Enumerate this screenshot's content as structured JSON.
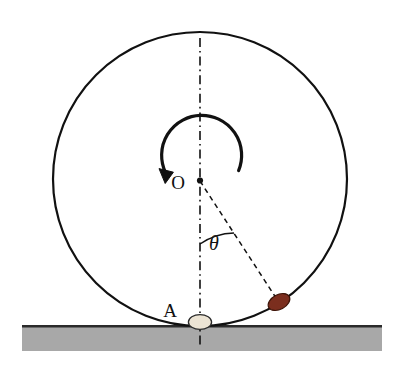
{
  "figure": {
    "background_color": "#ffffff"
  },
  "labels": {
    "center_label": "O",
    "contact_label": "A",
    "angle_label": "θ"
  },
  "colors": {
    "outline": "#111111",
    "ground_fill": "#a8a8a8",
    "ground_edge": "#2b2b2b",
    "bead_red": "#7b2e1e",
    "bead_red_edge": "#3d1408",
    "bead_cream": "#ece4d4",
    "bead_cream_edge": "#2b2b2b",
    "dash_line": "#111111"
  },
  "geometry": {
    "circle": {
      "center_x": 200,
      "center_y": 179,
      "radius": 147,
      "stroke_width": 2.2
    },
    "center_dot": {
      "cx": 200,
      "cy": 180,
      "r": 3.1
    },
    "vertical_axis": {
      "x": 200,
      "y_top": 38,
      "y_bottom": 345,
      "style": "dash-dot"
    },
    "radius_line": {
      "x1": 200,
      "y1": 181,
      "x2": 279,
      "y2": 302,
      "style": "dashed"
    },
    "angle_arc": {
      "radius": 63,
      "start_deg": 90,
      "end_deg": 57,
      "label_x": 214,
      "label_y": 249
    },
    "rotation_arc": {
      "radius": 40,
      "start_deg": 15,
      "end_deg": 185,
      "direction": "counterclockwise",
      "arrow_x": 165,
      "arrow_y": 179
    },
    "bead_red": {
      "cx": 279,
      "cy": 302,
      "rx": 11.5,
      "ry": 7.5,
      "rotation_deg": -28
    },
    "bead_cream": {
      "cx": 200,
      "cy": 322,
      "rx": 11.5,
      "ry": 7.5,
      "rotation_deg": 0
    },
    "ground": {
      "x": 22,
      "y": 325,
      "width": 360,
      "height": 26
    },
    "center_label_pos": {
      "x": 178,
      "y": 189
    },
    "contact_label_pos": {
      "x": 170,
      "y": 317
    }
  }
}
